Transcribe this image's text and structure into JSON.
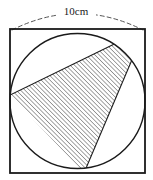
{
  "figure": {
    "dimension_label": "10cm",
    "colors": {
      "stroke": "#1a1a1a",
      "hatch": "#2b2b2b",
      "background": "#ffffff",
      "dashed_guide": "#555555"
    },
    "square": {
      "label": "square-outline",
      "x": 10,
      "y": 29,
      "width": 135,
      "height": 144,
      "side_length_text": "10cm"
    },
    "circle": {
      "label": "inscribed-circle",
      "cx": 77.5,
      "cy": 101,
      "r": 67.5
    },
    "dashed_arc": {
      "label": "dimension-arc",
      "from_x": 10,
      "from_y": 29,
      "to_x": 145,
      "to_y": 29,
      "peak_y": 12
    },
    "apex": {
      "label": "top-right-corner-apex",
      "x": 145,
      "y": 29
    },
    "shaded_region": {
      "label": "hatched-curved-triangle",
      "left_vertex_x": 10,
      "left_vertex_y": 95,
      "bottom_vertex_x": 84,
      "bottom_vertex_y": 173,
      "hatch_angle_deg": 45,
      "hatch_spacing_px": 3
    },
    "label_position": {
      "x": 76,
      "y": 13
    }
  }
}
